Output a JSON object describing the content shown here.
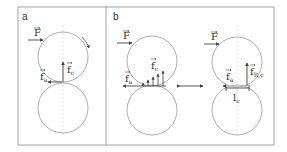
{
  "figure": {
    "panels": [
      {
        "id": "a",
        "label": "a",
        "vectors": {
          "force": "F",
          "adhesion": "f",
          "adhesion_sub": "a",
          "contact": "f",
          "contact_sub": "c"
        }
      },
      {
        "id": "b",
        "label": "b",
        "left": {
          "force": "F",
          "adhesion": "f",
          "adhesion_sub": "a",
          "contact": "f",
          "contact_sub": "c"
        },
        "right": {
          "force": "F",
          "adhesion": "f",
          "adhesion_sub": "a",
          "resultant": "f",
          "resultant_sub": "R,c",
          "length": "l",
          "length_sub": "c"
        }
      }
    ],
    "colors": {
      "line": "#555555",
      "circle": "#9a9a9a",
      "frame": "#8c8c8c",
      "axis": "#cfcfcf"
    }
  }
}
